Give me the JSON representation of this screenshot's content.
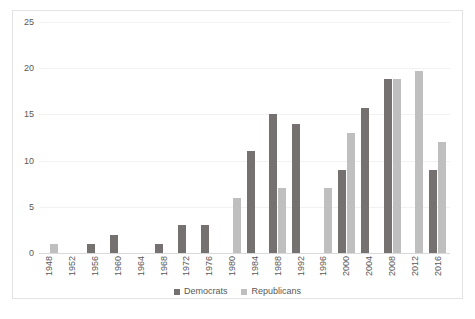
{
  "chart_data": {
    "type": "bar",
    "title": "",
    "subtitle": "",
    "xlabel": "",
    "ylabel": "",
    "ylim": [
      0,
      25
    ],
    "yticks": [
      0,
      5,
      10,
      15,
      20,
      25
    ],
    "grid": true,
    "legend_position": "bottom",
    "categories": [
      "1948",
      "1952",
      "1956",
      "1960",
      "1964",
      "1968",
      "1972",
      "1976",
      "1980",
      "1984",
      "1988",
      "1992",
      "1996",
      "2000",
      "2004",
      "2008",
      "2012",
      "2016"
    ],
    "series": [
      {
        "name": "Democrats",
        "color": "#767171",
        "values": [
          0,
          0,
          1,
          2,
          0,
          1,
          3,
          3,
          0,
          11,
          15,
          14,
          0,
          9,
          15.7,
          18.8,
          0,
          9
        ]
      },
      {
        "name": "Republicans",
        "color": "#bfbfbf",
        "values": [
          1,
          0,
          0,
          0,
          0,
          0,
          0,
          0,
          6,
          0,
          7,
          0,
          7,
          13,
          0,
          18.8,
          19.7,
          12
        ]
      }
    ]
  },
  "legend": {
    "items": [
      {
        "label": "Democrats",
        "color": "#767171"
      },
      {
        "label": "Republicans",
        "color": "#bfbfbf"
      }
    ]
  }
}
